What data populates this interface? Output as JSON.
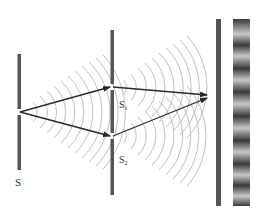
{
  "diagram": {
    "labels": {
      "source": "S",
      "slit1": "S",
      "slit1_sub": "1",
      "slit2": "S",
      "slit2_sub": "2"
    },
    "colors": {
      "barrier": "#555555",
      "arrow": "#2a2a2a",
      "wavefront": "#b8b8b8",
      "fringe_dark": "#3a3a3a",
      "fringe_light": "#c8c8c8",
      "label": "#333333"
    },
    "elements": [
      {
        "id": "source-barrier",
        "x": 19,
        "y1": 54,
        "y2": 170,
        "slit_y": 112
      },
      {
        "id": "double-slit-barrier",
        "x": 112,
        "y1": 30,
        "y2": 195,
        "slits_y": [
          87,
          136
        ]
      },
      {
        "id": "screen",
        "x": 218,
        "y1": 19,
        "y2": 206
      },
      {
        "id": "fringe-pattern",
        "x": 233,
        "width": 17,
        "y1": 19,
        "y2": 206,
        "bright_bands_y": [
          34,
          56,
          80,
          104,
          128,
          152,
          175,
          196
        ]
      }
    ]
  }
}
